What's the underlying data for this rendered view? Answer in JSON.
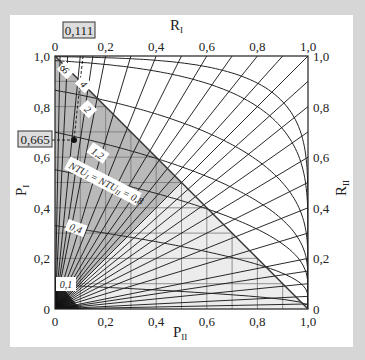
{
  "chart_data": {
    "type": "line",
    "title": "",
    "xlabel": "P_II",
    "ylabel": "P_I",
    "top_axis_label": "R_I",
    "right_axis_label": "R_II",
    "xlim": [
      0,
      1
    ],
    "ylim": [
      0,
      1
    ],
    "grid": true,
    "grid_step": 0.1,
    "x_ticks": [
      "0",
      "0,2",
      "0,4",
      "0,6",
      "0,8",
      "1,0"
    ],
    "y_ticks": [
      "0",
      "0,2",
      "0,4",
      "0,6",
      "0,8",
      "1,0"
    ],
    "top_ticks": [
      "0",
      "0,2",
      "0,4",
      "0,6",
      "0,8",
      "1,0"
    ],
    "right_ticks": [
      "0",
      "0,2",
      "0,4",
      "0,6",
      "0,8",
      "1,0"
    ],
    "r_lines": {
      "top_edge_R_I": [
        0.02,
        0.05,
        0.1,
        0.15,
        0.2,
        0.3,
        0.4,
        0.5,
        0.6,
        0.7,
        0.8,
        0.9,
        1.0
      ],
      "right_edge_R_II": [
        0.02,
        0.05,
        0.1,
        0.15,
        0.2,
        0.3,
        0.4,
        0.5,
        0.6,
        0.7,
        0.8,
        0.9
      ]
    },
    "ntu_curves": [
      {
        "label": "0,1",
        "ntu": 0.1
      },
      {
        "label": "0,4",
        "ntu": 0.4
      },
      {
        "label": "NTU_I = NTU_II = 0,8",
        "ntu": 0.8
      },
      {
        "label": "1,2",
        "ntu": 1.2
      },
      {
        "label": "2",
        "ntu": 2
      },
      {
        "label": "4",
        "ntu": 4
      },
      {
        "label": "6",
        "ntu": 6
      }
    ],
    "annotations": {
      "highlighted_R_I": "0,111",
      "highlighted_P_I": "0,665",
      "sigma_label": "σ",
      "operating_point": {
        "P_II": 0.074,
        "P_I": 0.665
      }
    },
    "shading": {
      "dark_region_color": "#b9b9b9",
      "light_region_color": "#ececec"
    }
  },
  "labels": {
    "p2": "P",
    "p2_sub": "II",
    "p1": "P",
    "p1_sub": "I",
    "r1": "R",
    "r1_sub": "I",
    "r2": "R",
    "r2_sub": "II",
    "boxed_r": "0,111",
    "boxed_p": "0,665",
    "sigma": "σ",
    "c01": "0,1",
    "c04": "0,4",
    "c08": "NTU",
    "c12": "1,2",
    "c2": "2",
    "c4": "4",
    "c6": "6"
  }
}
